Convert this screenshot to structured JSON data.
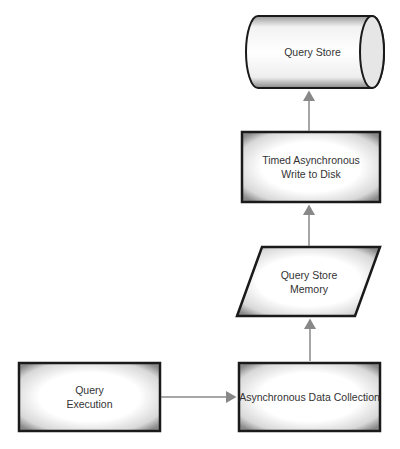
{
  "diagram": {
    "nodes": [
      {
        "id": "query_store",
        "label": "Query Store",
        "shape": "cylinder"
      },
      {
        "id": "timed_write",
        "label": "Timed Asynchronous\nWrite to Disk",
        "shape": "rectangle"
      },
      {
        "id": "qs_memory",
        "label": "Query Store\nMemory",
        "shape": "parallelogram"
      },
      {
        "id": "query_execution",
        "label": "Query\nExecution",
        "shape": "rectangle"
      },
      {
        "id": "async_collection",
        "label": "Asynchronous Data Collection",
        "shape": "rectangle"
      }
    ],
    "edges": [
      {
        "from": "query_execution",
        "to": "async_collection"
      },
      {
        "from": "async_collection",
        "to": "qs_memory"
      },
      {
        "from": "qs_memory",
        "to": "timed_write"
      },
      {
        "from": "timed_write",
        "to": "query_store"
      }
    ],
    "colors": {
      "border": "#1a1a1a",
      "fill_center": "#ffffff",
      "fill_edge": "#9a9a9a",
      "arrow": "#888888"
    }
  }
}
